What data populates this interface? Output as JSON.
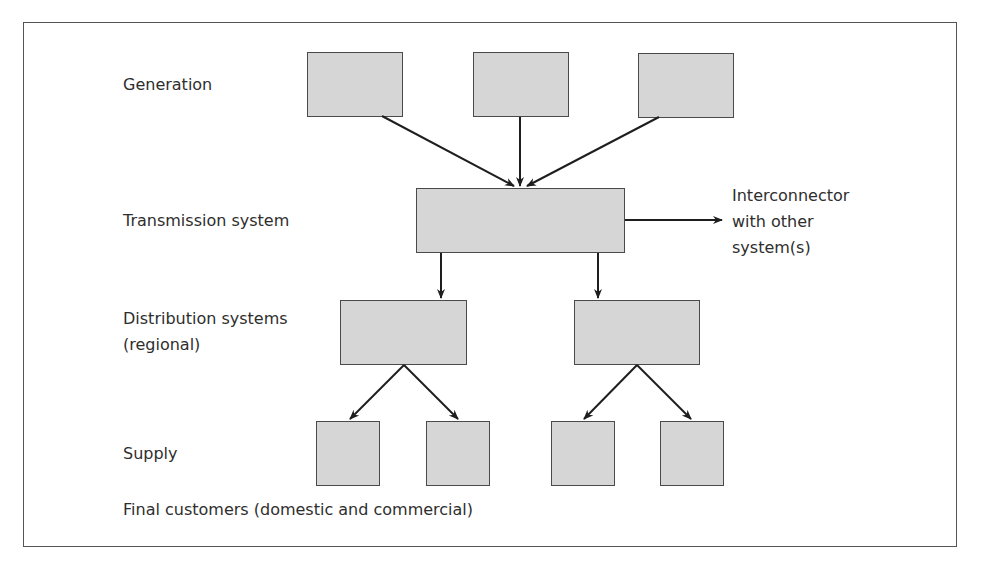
{
  "diagram": {
    "type": "hierarchy",
    "levels": [
      {
        "id": "generation",
        "label": "Generation",
        "node_count": 3
      },
      {
        "id": "transmission",
        "label": "Transmission system",
        "node_count": 1
      },
      {
        "id": "distribution",
        "label_line1": "Distribution systems",
        "label_line2": "(regional)",
        "node_count": 2
      },
      {
        "id": "supply",
        "label": "Supply",
        "node_count": 4
      }
    ],
    "footer_label": "Final customers (domestic and commercial)",
    "interconnector": {
      "line1": "Interconnector",
      "line2": "with other",
      "line3": "system(s)"
    },
    "edges": [
      [
        "generation-1",
        "transmission-1"
      ],
      [
        "generation-2",
        "transmission-1"
      ],
      [
        "generation-3",
        "transmission-1"
      ],
      [
        "transmission-1",
        "interconnector"
      ],
      [
        "transmission-1",
        "distribution-1"
      ],
      [
        "transmission-1",
        "distribution-2"
      ],
      [
        "distribution-1",
        "supply-1"
      ],
      [
        "distribution-1",
        "supply-2"
      ],
      [
        "distribution-2",
        "supply-3"
      ],
      [
        "distribution-2",
        "supply-4"
      ]
    ],
    "colors": {
      "box_fill": "#d6d6d6",
      "box_border": "#4a4a4a",
      "arrow": "#1e1e1e",
      "frame": "#555555",
      "text": "#2e2e2e"
    }
  }
}
